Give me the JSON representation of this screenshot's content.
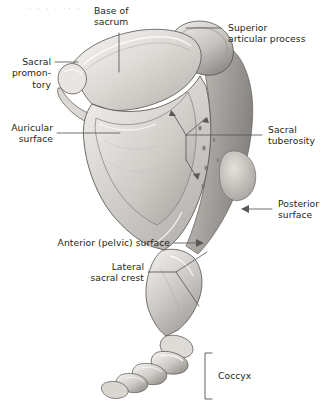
{
  "figure": {
    "title_region": "lateral view of sacrum and coccyx",
    "background_color": "#ffffff",
    "bone_colors": {
      "light": "#f2f0ee",
      "mid": "#cfccc8",
      "shadow": "#9d9a97",
      "deep_shadow": "#6f6d6b",
      "outline": "#4a4846"
    },
    "label_color": "#231f20",
    "leader_color": "#58585a",
    "watermark_text": "· ·  ·  ·  ·· ·"
  },
  "labels": {
    "base_of_sacrum": "Base of\nsacrum",
    "superior_articular_process": "Superior\narticular process",
    "sacral_promontory": "Sacral\npromon-\ntory",
    "auricular_surface": "Auricular\nsurface",
    "sacral_tuberosity": "Sacral\ntuberosity",
    "posterior_surface": "Posterior\nsurface",
    "anterior_pelvic_surface": "Anterior (pelvic) surface",
    "lateral_sacral_crest": "Lateral\nsacral crest",
    "coccyx": "Coccyx"
  }
}
